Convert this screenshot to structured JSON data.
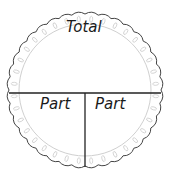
{
  "diagram": {
    "type": "part-part-whole",
    "total_label": "Total",
    "part_labels": [
      "Part",
      "Part"
    ],
    "colors": {
      "outline": "#333333",
      "inner_ring": "#cfcfcf",
      "lines": "#222222",
      "background": "#ffffff"
    }
  }
}
